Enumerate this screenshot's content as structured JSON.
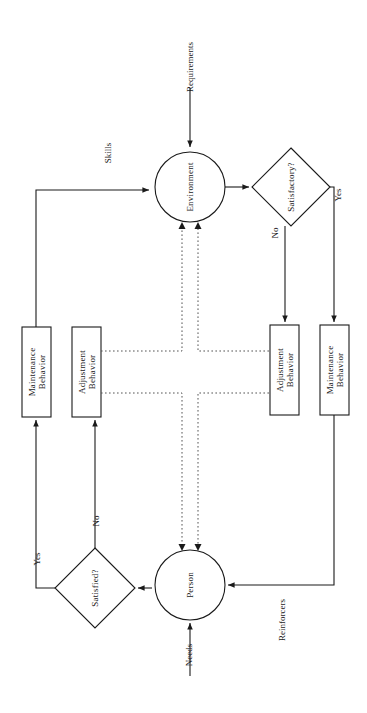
{
  "diagram": {
    "orientation": "rotated-90-ccw",
    "stroke_color": "#1a1a1a",
    "background_color": "#ffffff",
    "nodes": {
      "environment": {
        "label": "Environment",
        "shape": "circle"
      },
      "person": {
        "label": "Person",
        "shape": "circle"
      },
      "satisfactory": {
        "label": "Satisfactory?",
        "shape": "diamond"
      },
      "satisfied": {
        "label": "Satisfied?",
        "shape": "diamond"
      },
      "left_maintenance": {
        "label": "Maintenance\nBehavior",
        "shape": "rect"
      },
      "left_adjustment": {
        "label": "Adjustment\nBehavior",
        "shape": "rect"
      },
      "right_adjustment": {
        "label": "Adjustment\nBehavior",
        "shape": "rect"
      },
      "right_maintenance": {
        "label": "Maintenance\nBehavior",
        "shape": "rect"
      }
    },
    "edge_labels": {
      "requirements": "Requirements",
      "skills": "Skills",
      "needs": "Needs",
      "reinforcers": "Reinforcers",
      "satisfactory_no": "No",
      "satisfactory_yes": "Yes",
      "satisfied_no": "No",
      "satisfied_yes": "Yes"
    }
  }
}
